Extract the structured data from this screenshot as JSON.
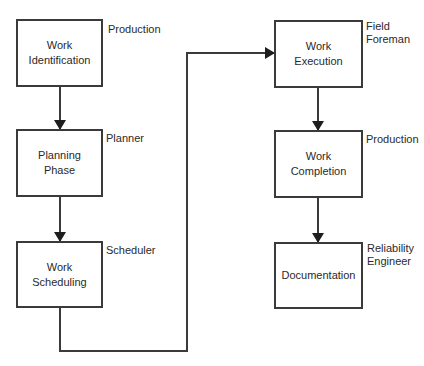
{
  "diagram": {
    "type": "flowchart",
    "nodes": [
      {
        "id": "work-identification",
        "label": "Work\nIdentification",
        "role": "Production"
      },
      {
        "id": "planning-phase",
        "label": "Planning\nPhase",
        "role": "Planner"
      },
      {
        "id": "work-scheduling",
        "label": "Work\nScheduling",
        "role": "Scheduler"
      },
      {
        "id": "work-execution",
        "label": "Work\nExecution",
        "role": "Field\nForeman"
      },
      {
        "id": "work-completion",
        "label": "Work\nCompletion",
        "role": "Production"
      },
      {
        "id": "documentation",
        "label": "Documentation",
        "role": "Reliability\nEngineer"
      }
    ],
    "edges": [
      {
        "from": "work-identification",
        "to": "planning-phase"
      },
      {
        "from": "planning-phase",
        "to": "work-scheduling"
      },
      {
        "from": "work-scheduling",
        "to": "work-execution"
      },
      {
        "from": "work-execution",
        "to": "work-completion"
      },
      {
        "from": "work-completion",
        "to": "documentation"
      }
    ],
    "colors": {
      "stroke": "#3a3a3a",
      "text": "#2a2a2a",
      "background": "#ffffff"
    }
  }
}
